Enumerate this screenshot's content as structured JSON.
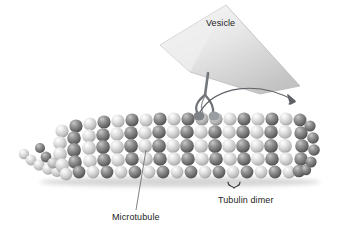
{
  "figure": {
    "background_color": "#ffffff",
    "width": 348,
    "height": 235
  },
  "labels": {
    "vesicle": "Vesicle",
    "microtubule": "Microtubule",
    "tubulin_dimer": "Tubulin dimer"
  },
  "colors": {
    "text": "#1b1b1b",
    "leader_line": "#6f7378",
    "arrow": "#5d6166",
    "motor_protein": "#6e7276",
    "vesicle_light": "#f2f2f2",
    "vesicle_mid": "#d9d9d9",
    "vesicle_dark": "#b9b9b9",
    "subunit_light": "#d8d8d8",
    "subunit_dark": "#6d6d6d",
    "shadow": "#c9c9c9"
  },
  "structure": {
    "microtubule": {
      "subunit_shape": "sphere",
      "protofilament_rows": 5,
      "column_count": 18,
      "column_pattern": [
        "light",
        "dark"
      ],
      "free_tail_subunits": 9
    },
    "vesicle": {
      "shape": "cone",
      "apex_x": 226,
      "apex_y": 4
    },
    "motor_protein": {
      "shape": "two-legged-stalk",
      "feet": 2
    },
    "motion_arrow": {
      "shape": "curved-arrow",
      "direction": "left-to-right",
      "arrowhead": "down-right"
    },
    "dimer_bracket": {
      "shape": "curly-brace",
      "spans_subunits": 2
    }
  }
}
